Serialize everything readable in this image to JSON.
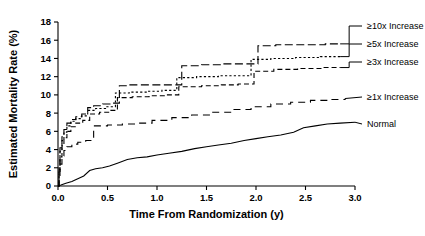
{
  "chart_data": {
    "type": "line",
    "title": "",
    "subtitle": "",
    "xlabel": "Time From Randomization (y)",
    "ylabel": "Estimated Mortality Rate (%)",
    "xlim": [
      0,
      3.0
    ],
    "ylim": [
      0,
      18
    ],
    "xticks": [
      "0.0",
      "0.5",
      "1.0",
      "1.5",
      "2.0",
      "2.5",
      "3.0"
    ],
    "xtick_values": [
      0.0,
      0.5,
      1.0,
      1.5,
      2.0,
      2.5,
      3.0
    ],
    "yticks": [
      "0",
      "2",
      "4",
      "6",
      "8",
      "10",
      "12",
      "14",
      "16",
      "18"
    ],
    "ytick_values": [
      0,
      2,
      4,
      6,
      8,
      10,
      12,
      14,
      16,
      18
    ],
    "grid": false,
    "legend_position": "right",
    "plot_kind": "kaplan-meier-step",
    "series": [
      {
        "name": "≥10x Increase",
        "label": "≥10x Increase",
        "linestyle": "long-dash",
        "color": "#000000",
        "final_value": 15.6,
        "points": [
          [
            0.0,
            0.0
          ],
          [
            0.01,
            2.0
          ],
          [
            0.02,
            4.2
          ],
          [
            0.04,
            5.4
          ],
          [
            0.06,
            6.2
          ],
          [
            0.09,
            6.9
          ],
          [
            0.13,
            7.3
          ],
          [
            0.18,
            7.6
          ],
          [
            0.24,
            7.9
          ],
          [
            0.3,
            8.6
          ],
          [
            0.36,
            8.8
          ],
          [
            0.45,
            9.0
          ],
          [
            0.55,
            9.1
          ],
          [
            0.62,
            11.0
          ],
          [
            0.72,
            11.1
          ],
          [
            0.95,
            11.1
          ],
          [
            1.12,
            11.1
          ],
          [
            1.25,
            13.2
          ],
          [
            1.45,
            13.3
          ],
          [
            1.65,
            13.4
          ],
          [
            1.85,
            13.4
          ],
          [
            2.02,
            15.4
          ],
          [
            2.2,
            15.5
          ],
          [
            2.45,
            15.5
          ],
          [
            2.7,
            15.6
          ],
          [
            2.85,
            15.6
          ]
        ]
      },
      {
        "name": "≥5x Increase",
        "label": "≥5x Increase",
        "linestyle": "dotted",
        "color": "#000000",
        "final_value": 14.2,
        "points": [
          [
            0.0,
            0.0
          ],
          [
            0.01,
            1.8
          ],
          [
            0.02,
            3.8
          ],
          [
            0.04,
            5.0
          ],
          [
            0.06,
            5.9
          ],
          [
            0.09,
            6.6
          ],
          [
            0.13,
            7.1
          ],
          [
            0.18,
            7.4
          ],
          [
            0.24,
            7.7
          ],
          [
            0.3,
            8.3
          ],
          [
            0.38,
            8.5
          ],
          [
            0.48,
            8.7
          ],
          [
            0.58,
            10.2
          ],
          [
            0.72,
            10.3
          ],
          [
            0.9,
            10.4
          ],
          [
            1.05,
            10.5
          ],
          [
            1.2,
            11.9
          ],
          [
            1.4,
            12.0
          ],
          [
            1.62,
            12.1
          ],
          [
            1.8,
            12.1
          ],
          [
            1.95,
            13.9
          ],
          [
            2.15,
            14.0
          ],
          [
            2.4,
            14.1
          ],
          [
            2.65,
            14.2
          ],
          [
            2.85,
            14.2
          ]
        ]
      },
      {
        "name": "≥3x Increase",
        "label": "≥3x Increase",
        "linestyle": "dashed",
        "color": "#000000",
        "final_value": 13.0,
        "points": [
          [
            0.0,
            0.0
          ],
          [
            0.01,
            1.5
          ],
          [
            0.02,
            3.2
          ],
          [
            0.04,
            4.4
          ],
          [
            0.06,
            5.3
          ],
          [
            0.09,
            6.0
          ],
          [
            0.13,
            6.5
          ],
          [
            0.18,
            6.9
          ],
          [
            0.25,
            7.2
          ],
          [
            0.32,
            7.9
          ],
          [
            0.42,
            8.1
          ],
          [
            0.52,
            8.3
          ],
          [
            0.6,
            9.7
          ],
          [
            0.75,
            9.8
          ],
          [
            0.92,
            9.9
          ],
          [
            1.08,
            10.0
          ],
          [
            1.22,
            10.9
          ],
          [
            1.45,
            11.0
          ],
          [
            1.65,
            11.1
          ],
          [
            1.82,
            11.2
          ],
          [
            1.98,
            12.6
          ],
          [
            2.18,
            12.8
          ],
          [
            2.42,
            12.9
          ],
          [
            2.68,
            13.0
          ],
          [
            2.85,
            13.0
          ]
        ]
      },
      {
        "name": "≥1x Increase",
        "label": "≥1x Increase",
        "linestyle": "long-dash-wide",
        "color": "#000000",
        "final_value": 9.6,
        "points": [
          [
            0.0,
            0.0
          ],
          [
            0.01,
            1.0
          ],
          [
            0.02,
            2.4
          ],
          [
            0.04,
            3.3
          ],
          [
            0.06,
            3.9
          ],
          [
            0.09,
            4.3
          ],
          [
            0.14,
            4.6
          ],
          [
            0.2,
            4.8
          ],
          [
            0.28,
            5.0
          ],
          [
            0.36,
            6.6
          ],
          [
            0.5,
            6.7
          ],
          [
            0.65,
            6.8
          ],
          [
            0.8,
            6.9
          ],
          [
            0.95,
            7.2
          ],
          [
            1.15,
            7.5
          ],
          [
            1.35,
            7.8
          ],
          [
            1.55,
            8.1
          ],
          [
            1.75,
            8.4
          ],
          [
            1.95,
            8.7
          ],
          [
            2.15,
            9.0
          ],
          [
            2.35,
            9.2
          ],
          [
            2.55,
            9.4
          ],
          [
            2.75,
            9.5
          ],
          [
            2.9,
            9.6
          ]
        ]
      },
      {
        "name": "Normal",
        "label": "Normal",
        "linestyle": "solid",
        "color": "#000000",
        "final_value": 7.0,
        "points": [
          [
            0.0,
            0.0
          ],
          [
            0.03,
            0.1
          ],
          [
            0.08,
            0.3
          ],
          [
            0.14,
            0.5
          ],
          [
            0.2,
            0.8
          ],
          [
            0.26,
            1.1
          ],
          [
            0.32,
            1.7
          ],
          [
            0.38,
            1.9
          ],
          [
            0.45,
            2.0
          ],
          [
            0.52,
            2.2
          ],
          [
            0.6,
            2.5
          ],
          [
            0.7,
            2.9
          ],
          [
            0.8,
            3.1
          ],
          [
            0.9,
            3.2
          ],
          [
            1.0,
            3.4
          ],
          [
            1.12,
            3.6
          ],
          [
            1.25,
            3.8
          ],
          [
            1.38,
            4.1
          ],
          [
            1.5,
            4.3
          ],
          [
            1.62,
            4.5
          ],
          [
            1.75,
            4.7
          ],
          [
            1.88,
            5.0
          ],
          [
            2.0,
            5.2
          ],
          [
            2.12,
            5.4
          ],
          [
            2.25,
            5.6
          ],
          [
            2.38,
            5.9
          ],
          [
            2.48,
            6.4
          ],
          [
            2.6,
            6.6
          ],
          [
            2.72,
            6.8
          ],
          [
            2.85,
            6.9
          ],
          [
            3.0,
            7.0
          ]
        ]
      }
    ]
  },
  "axes": {
    "xlabel": "Time From Randomization (y)",
    "ylabel": "Estimated Mortality Rate (%)"
  },
  "legend": {
    "items": [
      {
        "label": "≥10x Increase"
      },
      {
        "label": "≥5x Increase"
      },
      {
        "label": "≥3x Increase"
      },
      {
        "label": "≥1x Increase"
      },
      {
        "label": "Normal"
      }
    ]
  }
}
